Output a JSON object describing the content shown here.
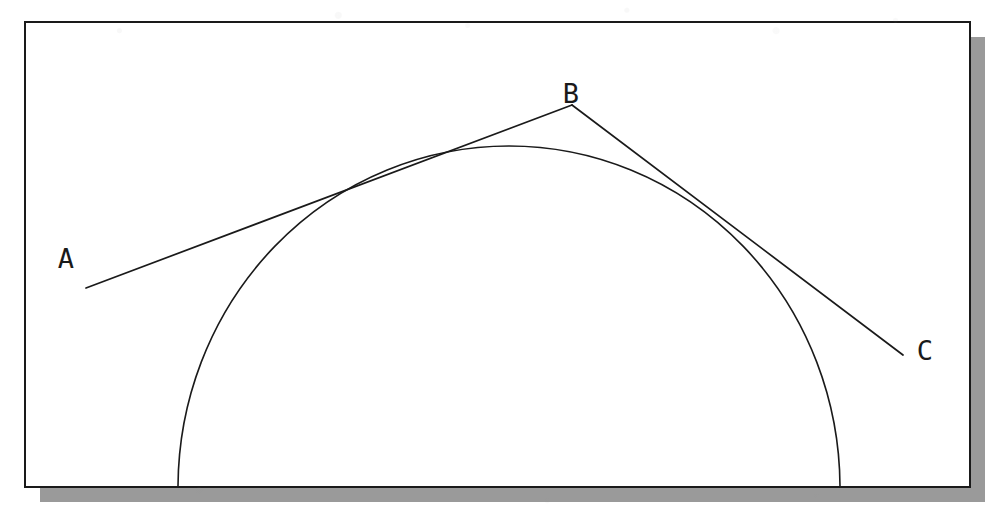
{
  "figure": {
    "background_color": "#ffffff",
    "ink_color": "#1a1a1a",
    "shadow_color": "#9a9a9a",
    "frame": {
      "name": "figure-border",
      "x": 25,
      "y": 22,
      "width": 945,
      "height": 465,
      "stroke_width": 2,
      "fill": "#ffffff",
      "stroke": "#1a1a1a"
    },
    "shadow": {
      "offset_x": 15,
      "offset_y": 15,
      "color": "#9a9a9a"
    },
    "arc": {
      "name": "semicircular-arc",
      "type": "elliptical-arc",
      "center_x": 509,
      "center_y": 488,
      "radius_x": 331,
      "radius_y": 342,
      "start_point": [
        178,
        488
      ],
      "apex_point": [
        509,
        146
      ],
      "end_point": [
        840,
        488
      ],
      "stroke_width": 1.6
    },
    "lines": [
      {
        "name": "tangent-line-ab",
        "from_label": "A",
        "to_label": "B",
        "from": [
          86,
          288
        ],
        "to": [
          572,
          105
        ],
        "stroke_width": 1.7,
        "tangent_point": [
          410,
          181
        ]
      },
      {
        "name": "tangent-line-bc",
        "from_label": "B",
        "to_label": "C",
        "from": [
          572,
          105
        ],
        "to": [
          903,
          355
        ],
        "stroke_width": 1.7,
        "tangent_point": [
          726,
          233
        ]
      }
    ],
    "labels": [
      {
        "name": "point-label-a",
        "text": "A",
        "x": 66,
        "y": 268,
        "anchor": "middle"
      },
      {
        "name": "point-label-b",
        "text": "B",
        "x": 571,
        "y": 103,
        "anchor": "middle"
      },
      {
        "name": "point-label-c",
        "text": "C",
        "x": 925,
        "y": 360,
        "anchor": "middle"
      }
    ]
  }
}
